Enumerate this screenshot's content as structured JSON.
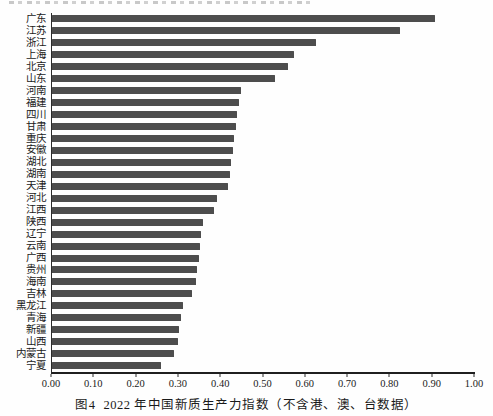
{
  "figure": {
    "caption_label": "图4",
    "caption_text": "2022 年中国新质生产力指数（不含港、澳、台数据）"
  },
  "chart_data": {
    "type": "bar",
    "orientation": "horizontal",
    "categories": [
      "广东",
      "江苏",
      "浙江",
      "上海",
      "北京",
      "山东",
      "河南",
      "福建",
      "四川",
      "甘肃",
      "重庆",
      "安徽",
      "湖北",
      "湖南",
      "天津",
      "河北",
      "江西",
      "陕西",
      "辽宁",
      "云南",
      "广西",
      "贵州",
      "海南",
      "吉林",
      "黑龙江",
      "青海",
      "新疆",
      "山西",
      "内蒙古",
      "宁夏"
    ],
    "values": [
      0.905,
      0.822,
      0.625,
      0.572,
      0.559,
      0.528,
      0.447,
      0.442,
      0.438,
      0.434,
      0.43,
      0.427,
      0.423,
      0.42,
      0.417,
      0.39,
      0.382,
      0.357,
      0.352,
      0.35,
      0.347,
      0.342,
      0.34,
      0.33,
      0.31,
      0.306,
      0.301,
      0.299,
      0.289,
      0.257
    ],
    "xlabel": "",
    "ylabel": "",
    "xlim": [
      0.0,
      1.0
    ],
    "x_ticks": [
      0.0,
      0.1,
      0.2,
      0.3,
      0.4,
      0.5,
      0.6,
      0.7,
      0.8,
      0.9,
      1.0
    ],
    "x_tick_labels": [
      "0.00",
      "0.10",
      "0.20",
      "0.30",
      "0.40",
      "0.50",
      "0.60",
      "0.70",
      "0.80",
      "0.90",
      "1.00"
    ],
    "grid": false,
    "legend": false,
    "bar_color": "#4d4d4d",
    "axis_color": "#2b2b2b"
  }
}
